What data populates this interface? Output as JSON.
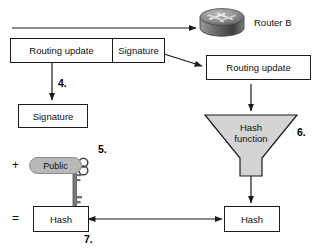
{
  "diagram": {
    "router": {
      "label": "Router B",
      "icon": "router-icon"
    },
    "packet": {
      "routing_update_label": "Routing update",
      "signature_label": "Signature"
    },
    "received_routing_update_label": "Routing update",
    "extracted_signature_label": "Signature",
    "hash_function": {
      "line1": "Hash",
      "line2": "function"
    },
    "public_key": {
      "label": "Public",
      "icon": "key-icon"
    },
    "hash_left_label": "Hash",
    "hash_right_label": "Hash",
    "operators": {
      "plus": "+",
      "equals": "="
    },
    "steps": {
      "four": "4.",
      "five": "5.",
      "six": "6.",
      "seven": "7."
    },
    "colors": {
      "stroke": "#1a1a1a",
      "fill": "#ffffff",
      "funnel_fill": "#d4d4d4",
      "pill_fill": "#b8b8b8",
      "router_body": "#6e6e6e",
      "text": "#111111"
    }
  }
}
